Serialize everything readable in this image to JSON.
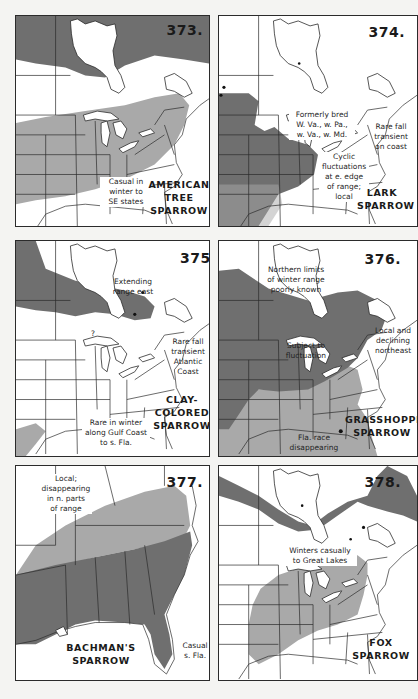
{
  "page": {
    "background": "#f4f4f2",
    "shading": {
      "summer_range": "#6f6f6f",
      "winter_range": "#a9a9a9",
      "resident": "#6f6f6f"
    }
  },
  "maps": [
    {
      "number": "373.",
      "species": [
        "AMERICAN",
        "TREE",
        "SPARROW"
      ],
      "notes": [
        {
          "id": "casual",
          "lines": [
            "Casual in",
            "winter to",
            "SE states"
          ]
        }
      ]
    },
    {
      "number": "374.",
      "species": [
        "LARK",
        "SPARROW"
      ],
      "notes": [
        {
          "id": "formerly",
          "lines": [
            "Formerly bred",
            "W. Va., w. Pa.,",
            "w. Va., w. Md."
          ]
        },
        {
          "id": "rare-fall",
          "lines": [
            "Rare fall",
            "transient",
            "on coast"
          ]
        },
        {
          "id": "cyclic",
          "lines": [
            "Cyclic",
            "fluctuations",
            "at e. edge",
            "of range;",
            "local"
          ]
        }
      ]
    },
    {
      "number": "375.",
      "species": [
        "CLAY-",
        "COLORED",
        "SPARROW"
      ],
      "notes": [
        {
          "id": "extending",
          "lines": [
            "Extending",
            "range east"
          ]
        },
        {
          "id": "question",
          "lines": [
            "?"
          ]
        },
        {
          "id": "rare-fall",
          "lines": [
            "Rare fall",
            "transient",
            "Atlantic",
            "Coast"
          ]
        },
        {
          "id": "rare-winter",
          "lines": [
            "Rare in winter",
            "along Gulf Coast",
            "to s. Fla."
          ]
        }
      ]
    },
    {
      "number": "376.",
      "species": [
        "GRASSHOPPER",
        "SPARROW"
      ],
      "notes": [
        {
          "id": "northern-limits",
          "lines": [
            "Northern limits",
            "of winter range",
            "poorly known"
          ]
        },
        {
          "id": "subject",
          "lines": [
            "Subject to",
            "fluctuation"
          ]
        },
        {
          "id": "local-declining",
          "lines": [
            "Local and",
            "declining",
            "northeast"
          ]
        },
        {
          "id": "fla-race",
          "lines": [
            "Fla. race",
            "disappearing"
          ]
        }
      ]
    },
    {
      "number": "377.",
      "species": [
        "BACHMAN'S",
        "SPARROW"
      ],
      "notes": [
        {
          "id": "local",
          "lines": [
            "Local;",
            "disappearing",
            "in n. parts",
            "of range"
          ]
        },
        {
          "id": "casual",
          "lines": [
            "Casual",
            "s. Fla."
          ]
        }
      ]
    },
    {
      "number": "378.",
      "species": [
        "FOX",
        "SPARROW"
      ],
      "notes": [
        {
          "id": "winters",
          "lines": [
            "Winters casually",
            "to Great Lakes"
          ]
        }
      ]
    }
  ]
}
